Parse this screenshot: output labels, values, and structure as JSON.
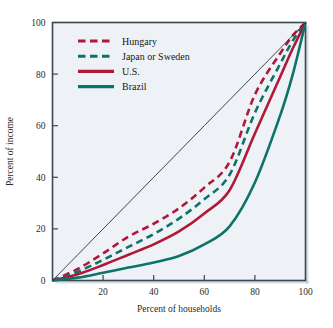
{
  "chart_data": {
    "type": "line",
    "title": "",
    "xlabel": "Percent of households",
    "ylabel": "Percent of income",
    "xlim": [
      0,
      100
    ],
    "ylim": [
      0,
      100
    ],
    "grid": false,
    "legend_position": "upper-left-inside",
    "xticks": [
      20,
      40,
      60,
      80,
      100
    ],
    "yticks": [
      0,
      20,
      40,
      60,
      80,
      100
    ],
    "xtick_labels": [
      "20",
      "40",
      "60",
      "80",
      "100"
    ],
    "ytick_labels": [
      "0",
      "20",
      "40",
      "60",
      "80",
      "100"
    ],
    "x": [
      0,
      10,
      20,
      30,
      40,
      50,
      60,
      70,
      80,
      90,
      95,
      100
    ],
    "series": [
      {
        "name": "Hungary",
        "style": "dashed",
        "color": "#b01838",
        "values": [
          0,
          4.5,
          10.5,
          17,
          22,
          28,
          36,
          46,
          72,
          88,
          95,
          100
        ]
      },
      {
        "name": "Japan or Sweden",
        "style": "dashed",
        "color": "#0d7369",
        "values": [
          0,
          3.4,
          8,
          13,
          18,
          24,
          31.5,
          41,
          65,
          84,
          93,
          100
        ]
      },
      {
        "name": "U.S.",
        "style": "solid",
        "color": "#b01838",
        "values": [
          0,
          2.4,
          6,
          10,
          14,
          19,
          26,
          35,
          57,
          79,
          90,
          100
        ]
      },
      {
        "name": "Brazil",
        "style": "solid",
        "color": "#0d7369",
        "values": [
          0,
          1.1,
          3,
          5,
          7,
          9.5,
          14,
          21,
          38,
          64,
          80,
          100
        ]
      },
      {
        "name": "Line of equality",
        "style": "thin",
        "color": "#24323c",
        "values": [
          0,
          10,
          20,
          30,
          40,
          50,
          60,
          70,
          80,
          90,
          95,
          100
        ]
      }
    ],
    "legend_entries": [
      {
        "label": "Hungary",
        "color": "#b01838",
        "style": "dashed"
      },
      {
        "label": "Japan or Sweden",
        "color": "#0d7369",
        "style": "dashed"
      },
      {
        "label": "U.S.",
        "color": "#b01838",
        "style": "solid"
      },
      {
        "label": "Brazil",
        "color": "#0d7369",
        "style": "solid"
      }
    ],
    "plot_background": "#eef2f6",
    "frame_color": "#3b4750"
  }
}
